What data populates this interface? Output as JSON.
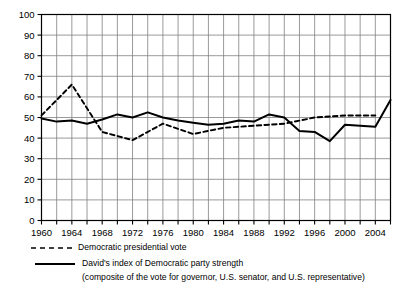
{
  "chart_data": {
    "type": "line",
    "title": "",
    "xlabel": "",
    "ylabel": "",
    "xlim": [
      1960,
      2006
    ],
    "ylim": [
      0,
      100
    ],
    "grid": true,
    "legend_position": "bottom",
    "y_ticks": [
      0,
      10,
      20,
      30,
      40,
      50,
      60,
      70,
      80,
      90,
      100
    ],
    "y_tick_labels": [
      "0",
      "10",
      "20",
      "30",
      "40",
      "50",
      "60",
      "70",
      "80",
      "90",
      "100"
    ],
    "x_ticks": [
      1960,
      1962,
      1964,
      1966,
      1968,
      1970,
      1972,
      1974,
      1976,
      1978,
      1980,
      1982,
      1984,
      1986,
      1988,
      1990,
      1992,
      1994,
      1996,
      1998,
      2000,
      2002,
      2004,
      2006
    ],
    "x_tick_labels": [
      "1960",
      "1964",
      "1968",
      "1972",
      "1976",
      "1980",
      "1984",
      "1988",
      "1992",
      "1996",
      "2000",
      "2004"
    ],
    "x_labeled_ticks": [
      1960,
      1964,
      1968,
      1972,
      1976,
      1980,
      1984,
      1988,
      1992,
      1996,
      2000,
      2004
    ],
    "series": [
      {
        "name": "Democratic presidential vote",
        "style": "dashed",
        "color": "#000000",
        "x": [
          1960,
          1964,
          1968,
          1972,
          1976,
          1980,
          1984,
          1988,
          1992,
          1996,
          2000,
          2004
        ],
        "values": [
          51,
          66,
          43,
          39,
          47,
          42,
          45,
          46,
          47,
          50,
          51,
          51
        ]
      },
      {
        "name": "David's index of Democratic party strength",
        "style": "solid",
        "color": "#000000",
        "x": [
          1960,
          1962,
          1964,
          1966,
          1968,
          1970,
          1972,
          1974,
          1976,
          1978,
          1980,
          1982,
          1984,
          1986,
          1988,
          1990,
          1992,
          1994,
          1996,
          1998,
          2000,
          2002,
          2004,
          2006
        ],
        "values": [
          49.5,
          48,
          48.5,
          47,
          49,
          51.5,
          50,
          52.5,
          50,
          48.5,
          47.5,
          46.5,
          47,
          48.5,
          48,
          51.5,
          50,
          43.5,
          43,
          38.5,
          46.5,
          46,
          45.5,
          58.5
        ]
      }
    ]
  },
  "legend": {
    "items": [
      {
        "key": "dashed-line-swatch",
        "label": "Democratic presidential vote",
        "sublabel": ""
      },
      {
        "key": "solid-line-swatch",
        "label": "David's index of Democratic party strength",
        "sublabel": "(composite of the vote for governor, U.S. senator, and U.S. representative)"
      }
    ]
  },
  "colors": {
    "line": "#000000",
    "grid": "#808080",
    "axis": "#000000",
    "background": "#ffffff"
  }
}
